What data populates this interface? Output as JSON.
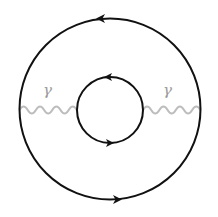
{
  "diagram": {
    "outer_loop": {
      "cx": 110,
      "cy": 109,
      "r": 90.5,
      "stroke": "#111111",
      "direction": "counter-clockwise",
      "arrows": [
        "top-left",
        "bottom-right"
      ]
    },
    "inner_loop": {
      "cx": 110,
      "cy": 110,
      "r": 33,
      "stroke": "#111111",
      "direction": "counter-clockwise",
      "arrows": [
        "top-left",
        "bottom-right"
      ]
    },
    "propagators": [
      {
        "label": "γ",
        "type": "wavy",
        "from_x": 19.5,
        "to_x": 77,
        "y": 110,
        "color": "#bdbdbd"
      },
      {
        "label": "γ",
        "type": "wavy",
        "from_x": 143,
        "to_x": 200.5,
        "y": 110,
        "color": "#bdbdbd"
      }
    ]
  }
}
